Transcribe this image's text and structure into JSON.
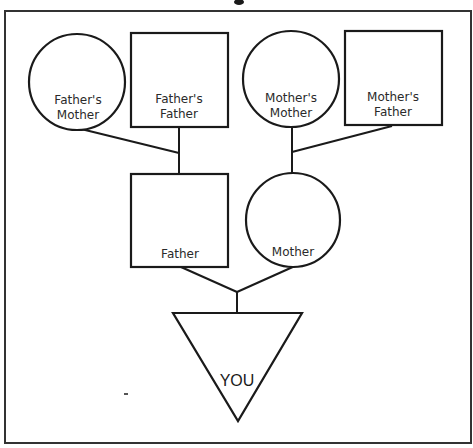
{
  "diagram": {
    "type": "family-tree",
    "title_fragment": "",
    "colors": {
      "stroke": "#1a1a1a",
      "frame": "#333333",
      "background": "#ffffff",
      "text": "#2a2a2a"
    },
    "generations": {
      "grandparents": [
        {
          "id": "fathers-mother",
          "shape": "circle",
          "line1": "Father's",
          "line2": "Mother"
        },
        {
          "id": "fathers-father",
          "shape": "square",
          "line1": "Father's",
          "line2": "Father"
        },
        {
          "id": "mothers-mother",
          "shape": "circle",
          "line1": "Mother's",
          "line2": "Mother"
        },
        {
          "id": "mothers-father",
          "shape": "square",
          "line1": "Mother's",
          "line2": "Father"
        }
      ],
      "parents": [
        {
          "id": "father",
          "shape": "square",
          "label": "Father"
        },
        {
          "id": "mother",
          "shape": "circle",
          "label": "Mother"
        }
      ],
      "self": {
        "id": "you",
        "shape": "inverted-triangle",
        "label": "YOU"
      }
    },
    "legend_convention": {
      "circle": "female",
      "square": "male",
      "triangle": "self"
    }
  }
}
